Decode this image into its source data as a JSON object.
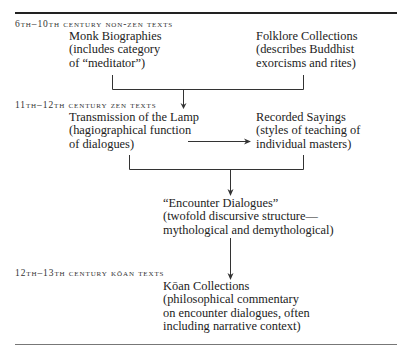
{
  "periods": [
    {
      "label": "6th–10th century non-zen texts"
    },
    {
      "label": "11th–12th century zen texts"
    },
    {
      "label": "12th–13th century kōan texts"
    }
  ],
  "nodes": {
    "monk_biographies": {
      "title": "Monk Biographies",
      "lines": [
        "(includes category",
        "of “meditator”)"
      ]
    },
    "folklore_collections": {
      "title": "Folklore Collections",
      "lines": [
        "(describes Buddhist",
        "exorcisms and rites)"
      ]
    },
    "transmission_of_the_lamp": {
      "title": "Transmission of the Lamp",
      "lines": [
        "(hagiographical function",
        "of dialogues)"
      ]
    },
    "recorded_sayings": {
      "title": "Recorded Sayings",
      "lines": [
        "(styles of teaching of",
        "individual masters)"
      ]
    },
    "encounter_dialogues": {
      "title": "“Encounter Dialogues”",
      "lines": [
        "(twofold discursive structure—",
        "mythological and demythological)"
      ]
    },
    "koan_collections": {
      "title": "Kōan Collections",
      "lines": [
        "(philosophical commentary",
        "on encounter dialogues, often",
        "including narrative context)"
      ]
    }
  },
  "colors": {
    "line": "#333333",
    "text": "#222222"
  }
}
